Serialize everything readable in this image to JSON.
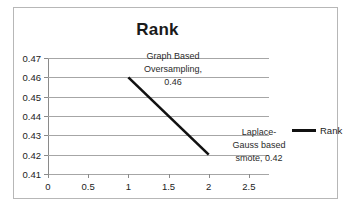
{
  "chart_data": {
    "type": "line",
    "title": "Rank",
    "xlabel": "",
    "ylabel": "",
    "x": [
      1,
      2
    ],
    "values": [
      0.46,
      0.42
    ],
    "categories": [
      "Graph Based Oversampling",
      "Laplace-Gauss based smote"
    ],
    "series": [
      {
        "name": "Rank",
        "values": [
          0.46,
          0.42
        ],
        "color": "#111111"
      }
    ],
    "point_labels": [
      "Graph Based\nOversampling,\n0.46",
      "Laplace-\nGauss based\nsmote, 0.42"
    ],
    "xlim": [
      0,
      2.75
    ],
    "ylim": [
      0.41,
      0.47
    ],
    "xticks": [
      "0",
      "0.5",
      "1",
      "1.5",
      "2",
      "2.5"
    ],
    "xtick_values": [
      0,
      0.5,
      1,
      1.5,
      2,
      2.5
    ],
    "yticks": [
      "0.47",
      "0.46",
      "0.45",
      "0.44",
      "0.43",
      "0.42",
      "0.41"
    ],
    "ytick_values": [
      0.47,
      0.46,
      0.45,
      0.44,
      0.43,
      0.42,
      0.41
    ],
    "grid": true,
    "legend": {
      "position": "right",
      "entries": [
        "Rank"
      ]
    }
  },
  "legend": {
    "label": "Rank"
  }
}
